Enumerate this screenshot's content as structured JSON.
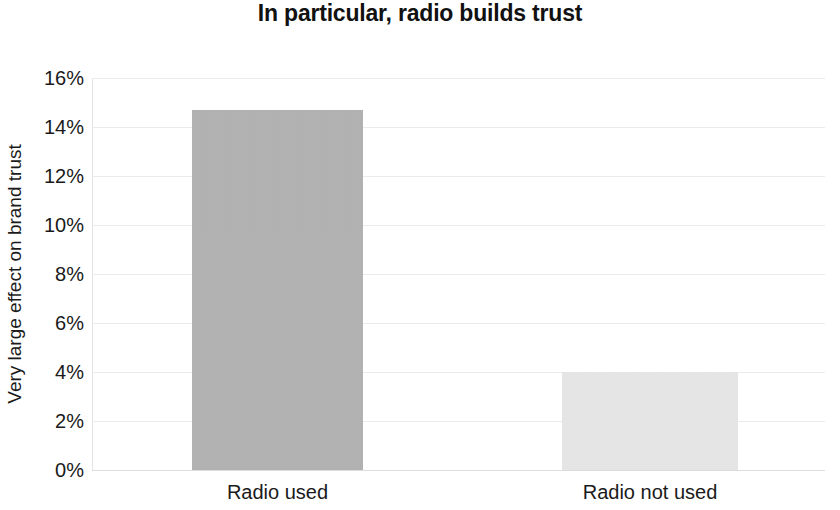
{
  "chart_data": {
    "type": "bar",
    "title": "In particular, radio builds trust",
    "xlabel": "",
    "ylabel": "Very large effect on brand trust",
    "categories": [
      "Radio used",
      "Radio not used"
    ],
    "values": [
      14.7,
      4.0
    ],
    "value_labels": [
      "14.7%",
      "4%"
    ],
    "ylim": [
      0,
      16
    ],
    "ytick_values": [
      0,
      2,
      4,
      6,
      8,
      10,
      12,
      14,
      16
    ],
    "ytick_labels": [
      "0%",
      "2%",
      "4%",
      "6%",
      "8%",
      "10%",
      "12%",
      "14%",
      "16%"
    ],
    "grid": true,
    "legend": false,
    "bar_colors": [
      "#b3b3b3",
      "#e8e8e8"
    ],
    "gridline_color": "#ebebeb",
    "background_color": "#ffffff",
    "text_color": "#1a1a1a"
  }
}
